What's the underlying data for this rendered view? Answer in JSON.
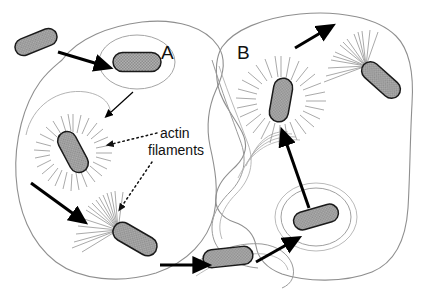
{
  "figure": {
    "kind": "diagram",
    "title_visible": false,
    "background_color": "#ffffff",
    "width": 422,
    "height": 292
  },
  "colors": {
    "bacterium_fill": "#a8a8a8",
    "bacterium_stroke": "#1a1a1a",
    "cell_membrane": "#8f8f8f",
    "actin_filament": "#9a9a9a",
    "arrow_solid": "#000000",
    "leader_line": "#333333",
    "text": "#111111"
  },
  "labels": {
    "cell_a": "A",
    "cell_b": "B",
    "actin_line1": "actin",
    "actin_line2": "filaments"
  },
  "cells": [
    {
      "id": "cell-a",
      "label": "A",
      "description": "host cell A outline"
    },
    {
      "id": "cell-b",
      "label": "B",
      "description": "host cell B outline"
    }
  ],
  "bacteria": [
    {
      "id": "bacterium-extracellular",
      "state": "extracellular free bacterium",
      "cell": "outside",
      "x": 36,
      "y": 42,
      "length": 44,
      "thickness": 17,
      "angle": -22,
      "actin": "none"
    },
    {
      "id": "bacterium-in-vacuole-a",
      "state": "internalized in phagocytic vacuole",
      "cell": "A",
      "x": 137,
      "y": 62,
      "length": 48,
      "thickness": 19,
      "angle": 0,
      "actin": "none",
      "vacuole_rings": 1
    },
    {
      "id": "bacterium-actin-cloud-a",
      "state": "surrounded by actin filament cloud",
      "cell": "A",
      "x": 73,
      "y": 152,
      "length": 44,
      "thickness": 19,
      "angle": 62,
      "actin": "starburst"
    },
    {
      "id": "bacterium-comet-a",
      "state": "motile with actin comet tail",
      "cell": "A",
      "x": 135,
      "y": 239,
      "length": 48,
      "thickness": 19,
      "angle": 30,
      "actin": "comet-tail"
    },
    {
      "id": "bacterium-protrusion",
      "state": "in membrane protrusion pushing into cell B",
      "cell": "A-to-B junction",
      "x": 228,
      "y": 257,
      "length": 50,
      "thickness": 18,
      "angle": -6,
      "actin": "none"
    },
    {
      "id": "bacterium-double-vacuole-b",
      "state": "in double-membrane vacuole after transfer",
      "cell": "B",
      "x": 316,
      "y": 217,
      "length": 46,
      "thickness": 18,
      "angle": -16,
      "actin": "none",
      "vacuole_rings": 2
    },
    {
      "id": "bacterium-actin-cloud-b",
      "state": "surrounded by actin filament cloud",
      "cell": "B",
      "x": 281,
      "y": 100,
      "length": 44,
      "thickness": 19,
      "angle": 100,
      "actin": "starburst"
    },
    {
      "id": "bacterium-comet-b",
      "state": "motile with actin comet tail toward membrane",
      "cell": "B",
      "x": 381,
      "y": 80,
      "length": 46,
      "thickness": 18,
      "angle": 42,
      "actin": "comet-tail"
    }
  ],
  "arrows": [
    {
      "id": "arrow-entry-a",
      "style": "solid-filled",
      "from": [
        58,
        52
      ],
      "to": [
        107,
        67
      ],
      "meaning": "bacterium enters cell A"
    },
    {
      "id": "arrow-escape-a",
      "style": "thin-filled",
      "from": [
        130,
        96
      ],
      "to": [
        100,
        121
      ],
      "meaning": "escape from vacuole into cytoplasm"
    },
    {
      "id": "arrow-motility-a",
      "style": "solid-filled",
      "from": [
        31,
        183
      ],
      "to": [
        84,
        222
      ],
      "meaning": "actin-based movement through cytoplasm"
    },
    {
      "id": "arrow-to-protrusion",
      "style": "solid-filled",
      "from": [
        160,
        265
      ],
      "to": [
        207,
        265
      ],
      "meaning": "bacterium pushes into protrusion"
    },
    {
      "id": "arrow-into-cell-b",
      "style": "solid-filled",
      "from": [
        256,
        262
      ],
      "to": [
        297,
        239
      ],
      "meaning": "transfer into neighbouring cell B"
    },
    {
      "id": "arrow-escape-b",
      "style": "solid-filled",
      "from": [
        309,
        208
      ],
      "to": [
        283,
        135
      ],
      "meaning": "escape from double membrane vacuole"
    },
    {
      "id": "arrow-spread-out-b",
      "style": "solid-filled",
      "from": [
        295,
        48
      ],
      "to": [
        330,
        27
      ],
      "meaning": "continued spread out of cell B"
    }
  ],
  "leader_lines": [
    {
      "id": "leader-actin-cloud",
      "style": "dotted",
      "from": [
        157,
        133
      ],
      "to": [
        104,
        146
      ],
      "target": "bacterium-actin-cloud-a"
    },
    {
      "id": "leader-comet-tail",
      "style": "dotted",
      "from": [
        152,
        160
      ],
      "to": [
        118,
        212
      ],
      "target": "bacterium-comet-a"
    }
  ]
}
